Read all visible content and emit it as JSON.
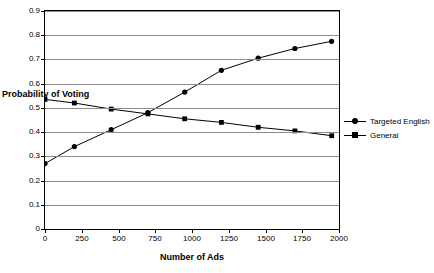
{
  "chart_data": {
    "type": "line",
    "title": "",
    "xlabel": "Number of Ads",
    "ylabel": "Probability of Voting",
    "xlim": [
      0,
      2000
    ],
    "ylim": [
      0,
      0.9
    ],
    "grid": true,
    "legend_position": "right",
    "x_ticks": [
      "0",
      "250",
      "500",
      "750",
      "1000",
      "1250",
      "1500",
      "1750",
      "2000"
    ],
    "y_ticks": [
      "0",
      "0.1",
      "0.2",
      "0.3",
      "0.4",
      "0.5",
      "0.6",
      "0.7",
      "0.8",
      "0.9"
    ],
    "x": [
      0,
      200,
      450,
      700,
      950,
      1200,
      1450,
      1700,
      1950
    ],
    "series": [
      {
        "name": "Targeted English",
        "marker": "circle",
        "color": "#000000",
        "values": [
          0.27,
          0.34,
          0.41,
          0.48,
          0.565,
          0.655,
          0.705,
          0.745,
          0.775
        ]
      },
      {
        "name": "General",
        "marker": "square",
        "color": "#000000",
        "values": [
          0.535,
          0.52,
          0.495,
          0.475,
          0.455,
          0.44,
          0.42,
          0.405,
          0.385
        ]
      }
    ]
  },
  "legend": {
    "entries": [
      {
        "label": "Targeted English"
      },
      {
        "label": "General"
      }
    ]
  },
  "axes": {
    "x_title": "Number of Ads",
    "y_title": "Probability of Voting"
  }
}
